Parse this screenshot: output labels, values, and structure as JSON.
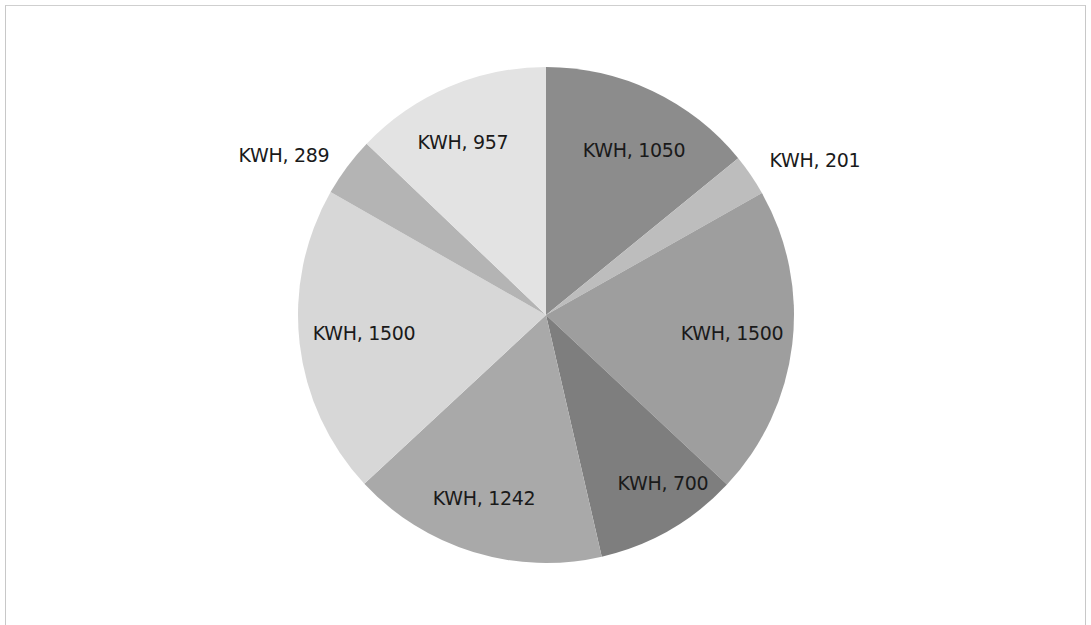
{
  "chart_data": {
    "type": "pie",
    "title": "",
    "start_angle_deg": 0,
    "direction": "clockwise",
    "center": [
      546,
      315
    ],
    "radius": 248,
    "categories": [
      "KWH",
      "KWH",
      "KWH",
      "KWH",
      "KWH",
      "KWH",
      "KWH",
      "KWH"
    ],
    "values": [
      1050,
      201,
      1500,
      700,
      1242,
      1500,
      289,
      957
    ],
    "slices": [
      {
        "category": "KWH",
        "value": 1050,
        "label": "KWH, 1050",
        "color": "#8c8c8c",
        "label_pos": [
          634,
          150
        ]
      },
      {
        "category": "KWH",
        "value": 201,
        "label": "KWH, 201",
        "color": "#bdbdbd",
        "label_pos": [
          815,
          160
        ]
      },
      {
        "category": "KWH",
        "value": 1500,
        "label": "KWH, 1500",
        "color": "#9e9e9e",
        "label_pos": [
          732,
          333
        ]
      },
      {
        "category": "KWH",
        "value": 700,
        "label": "KWH, 700",
        "color": "#7e7e7e",
        "label_pos": [
          663,
          483
        ]
      },
      {
        "category": "KWH",
        "value": 1242,
        "label": "KWH, 1242",
        "color": "#a9a9a9",
        "label_pos": [
          484,
          498
        ]
      },
      {
        "category": "KWH",
        "value": 1500,
        "label": "KWH, 1500",
        "color": "#d7d7d7",
        "label_pos": [
          364,
          333
        ]
      },
      {
        "category": "KWH",
        "value": 289,
        "label": "KWH, 289",
        "color": "#b4b4b4",
        "label_pos": [
          284,
          155
        ]
      },
      {
        "category": "KWH",
        "value": 957,
        "label": "KWH, 957",
        "color": "#e3e3e3",
        "label_pos": [
          463,
          142
        ]
      }
    ],
    "legend": "none",
    "grid": false
  }
}
